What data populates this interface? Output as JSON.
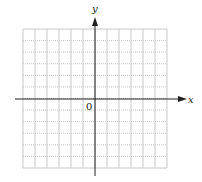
{
  "diagram": {
    "type": "coordinate-grid",
    "x_axis_label": "x",
    "y_axis_label": "y",
    "origin_label": "0",
    "grid": {
      "columns": 12,
      "rows": 12
    },
    "colors": {
      "axis": "#222222",
      "grid": "#c8c8c8",
      "background": "#ffffff"
    }
  }
}
